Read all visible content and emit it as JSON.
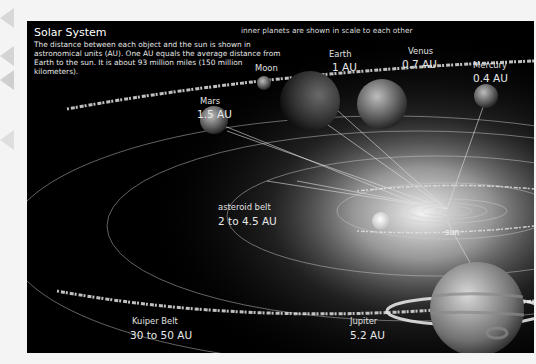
{
  "header": {
    "title": "Solar System",
    "description": "The distance between each object and the sun is shown in astronomical units (AU). One AU equals the average distance from Earth to the sun. It is about 93 million miles (150 million kilometers).",
    "scale_note": "inner planets are shown in scale to each other"
  },
  "objects": {
    "moon": {
      "name": "Moon"
    },
    "earth": {
      "name": "Earth",
      "distance": "1 AU"
    },
    "venus": {
      "name": "Venus",
      "distance": "0.7 AU"
    },
    "mercury": {
      "name": "Mercury",
      "distance": "0.4 AU"
    },
    "mars": {
      "name": "Mars",
      "distance": "1.5 AU"
    },
    "asteroid_belt": {
      "name": "asteroid belt",
      "distance": "2 to 4.5 AU"
    },
    "sun": {
      "name": "sun"
    },
    "kuiper_belt": {
      "name": "Kuiper Belt",
      "distance": "30 to 50 AU"
    },
    "jupiter": {
      "name": "Jupiter",
      "distance": "5.2 AU"
    }
  },
  "colors": {
    "background": "#000000",
    "page": "#f4f4f4",
    "label": "#e8e8e8",
    "sun_glow": "#ffffff"
  }
}
